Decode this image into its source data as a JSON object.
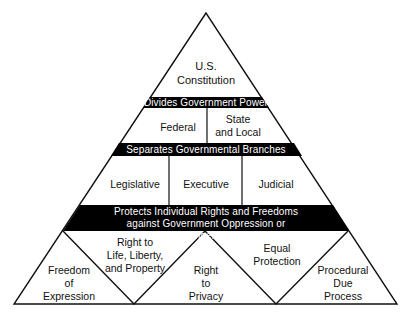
{
  "diagram": {
    "type": "pyramid",
    "apex": {
      "label": "U.S.\nConstitution"
    },
    "bands": [
      {
        "label": "Divides Government Power"
      },
      {
        "label": "Separates Governmental Branches"
      },
      {
        "label": "Protects Individual Rights and Freedoms\nagainst Government Oppression or Infringement"
      }
    ],
    "tiers": [
      {
        "cells": [
          {
            "label": "Federal"
          },
          {
            "label": "State\nand Local"
          }
        ]
      },
      {
        "cells": [
          {
            "label": "Legislative"
          },
          {
            "label": "Executive"
          },
          {
            "label": "Judicial"
          }
        ]
      },
      {
        "cells": [
          {
            "label": "Freedom\nof\nExpression"
          },
          {
            "label": "Right to\nLife, Liberty,\nand Property"
          },
          {
            "label": "Right\nto\nPrivacy"
          },
          {
            "label": "Equal\nProtection"
          },
          {
            "label": "Procedural\nDue\nProcess"
          }
        ]
      }
    ],
    "colors": {
      "band_fill": "#000000",
      "band_text": "#ffffff",
      "line": "#111111",
      "background": "#ffffff"
    }
  }
}
